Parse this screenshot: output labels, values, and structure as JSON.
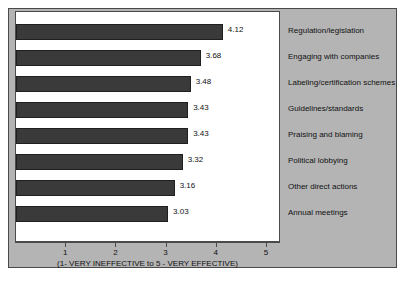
{
  "chart_data": {
    "type": "bar",
    "orientation": "horizontal",
    "title": "",
    "xlabel": "(1- VERY INEFFECTIVE to 5 - VERY EFFECTIVE)",
    "ylabel": "",
    "xlim": [
      0,
      5.5
    ],
    "xticks": [
      1,
      2,
      3,
      4,
      5
    ],
    "xticklabels": [
      "1",
      "2",
      "3",
      "4",
      "5"
    ],
    "grid": false,
    "legend": "right-label-column",
    "categories": [
      "Regulation/legislation",
      "Engaging with companies",
      "Labeling/certification schemes",
      "Guidelines/standards",
      "Praising and blaming",
      "Political lobbying",
      "Other direct actions",
      "Annual meetings"
    ],
    "values": [
      4.12,
      3.68,
      3.48,
      3.43,
      3.43,
      3.32,
      3.16,
      3.03
    ],
    "value_labels": [
      "4.12",
      "3.68",
      "3.48",
      "3.43",
      "3.43",
      "3.32",
      "3.16",
      "3.03"
    ],
    "bar_color": "#3a3a3a",
    "panel_color": "#b4b4b4",
    "plot_background": "#ffffff"
  }
}
